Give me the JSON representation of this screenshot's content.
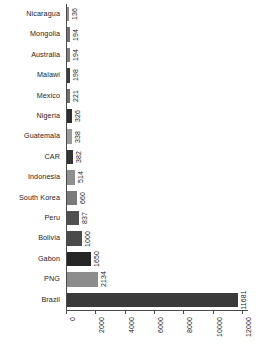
{
  "chart_data": {
    "type": "bar",
    "orientation": "horizontal",
    "title": "",
    "subtitle": "",
    "xlabel": "",
    "ylabel": "",
    "grid": false,
    "legend": null,
    "xlim": [
      0,
      12400
    ],
    "xticks": [
      0,
      2000,
      4000,
      6000,
      8000,
      10000,
      12000
    ],
    "xtick_labels": [
      "0",
      "2000",
      "4000",
      "6000",
      "8000",
      "10000",
      "12000"
    ],
    "categories": [
      "Nicaragua",
      "Mongolia",
      "Australia",
      "Malawi",
      "Mexico",
      "Nigeria",
      "Guatemala",
      "CAR",
      "Indonesia",
      "South Korea",
      "Peru",
      "Bolivia",
      "Gabon",
      "PNG",
      "Brazil"
    ],
    "values": [
      136,
      194,
      194,
      198,
      221,
      326,
      338,
      382,
      514,
      660,
      837,
      1000,
      1650,
      2134,
      11681
    ],
    "value_labels": [
      "136",
      "194",
      "194",
      "198",
      "221",
      "326",
      "338",
      "382",
      "514",
      "660",
      "837",
      "1000",
      "1650",
      "2134",
      "11681"
    ],
    "bar_colors": [
      "#8a8a8a",
      "#707070",
      "#7d7d7d",
      "#3c3c3c",
      "#6e6e6e",
      "#2e2e2e",
      "#9a9a9a",
      "#343434",
      "#8f8f8f",
      "#7a7a7a",
      "#505050",
      "#4a4a4a",
      "#262626",
      "#8c8c8c",
      "#3a3a3a"
    ],
    "axis_color": "#4a4a4a",
    "background": "#ffffff"
  }
}
